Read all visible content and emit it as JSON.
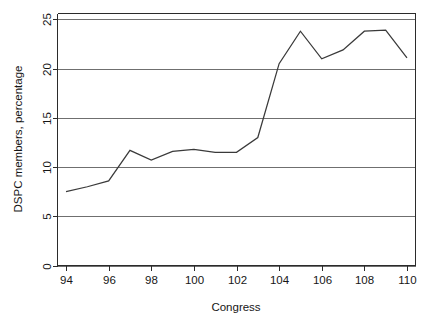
{
  "chart_data": {
    "type": "line",
    "title": "",
    "xlabel": "Congress",
    "ylabel": "DSPC members, percentage",
    "xlim": [
      93.6,
      110.4
    ],
    "ylim": [
      0,
      25.6
    ],
    "grid": true,
    "legend": false,
    "x": [
      94,
      95,
      96,
      97,
      98,
      99,
      100,
      101,
      102,
      103,
      104,
      105,
      106,
      107,
      108,
      109,
      110
    ],
    "values": [
      7.5,
      8.0,
      8.6,
      11.7,
      10.7,
      11.6,
      11.8,
      11.5,
      11.5,
      13.0,
      20.5,
      23.8,
      21.0,
      21.9,
      23.8,
      23.9,
      21.1
    ],
    "series": [
      {
        "name": "DSPC members",
        "values": [
          7.5,
          8.0,
          8.6,
          11.7,
          10.7,
          11.6,
          11.8,
          11.5,
          11.5,
          13.0,
          20.5,
          23.8,
          21.0,
          21.9,
          23.8,
          23.9,
          21.1
        ]
      }
    ],
    "x_ticks": [
      94,
      96,
      98,
      100,
      102,
      104,
      106,
      108,
      110
    ],
    "x_tick_labels": [
      "94",
      "96",
      "98",
      "100",
      "102",
      "104",
      "106",
      "108",
      "110"
    ],
    "y_ticks": [
      0,
      5,
      10,
      15,
      20,
      25
    ],
    "y_tick_labels": [
      "0",
      "5",
      "10",
      "15",
      "20",
      "25"
    ],
    "gridline_values": [
      0,
      5,
      10,
      15,
      20,
      25
    ],
    "line_color": "#3a3a3a",
    "grid_color": "#6f6f6f",
    "frame_color": "#2b2b2b",
    "background_color": "#ffffff"
  }
}
